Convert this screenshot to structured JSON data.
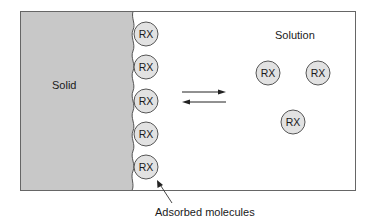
{
  "diagram": {
    "regions": {
      "solid_label": "Solid",
      "solution_label": "Solution"
    },
    "molecule_label": "RX",
    "adsorbed_molecules": [
      {
        "label": "RX",
        "cx": 146,
        "cy": 34
      },
      {
        "label": "RX",
        "cx": 146,
        "cy": 67
      },
      {
        "label": "RX",
        "cx": 146,
        "cy": 101
      },
      {
        "label": "RX",
        "cx": 146,
        "cy": 134
      },
      {
        "label": "RX",
        "cx": 146,
        "cy": 167
      }
    ],
    "solution_molecules": [
      {
        "label": "RX",
        "cx": 268,
        "cy": 73
      },
      {
        "label": "RX",
        "cx": 318,
        "cy": 73
      },
      {
        "label": "RX",
        "cx": 293,
        "cy": 122
      }
    ],
    "equilibrium_arrows": {
      "forward": "right",
      "reverse": "left"
    },
    "annotation": "Adsorbed molecules",
    "colors": {
      "solid_fill": "#c8c8c8",
      "molecule_fill": "#e2e2e2",
      "stroke": "#555555",
      "frame": "#666666",
      "text": "#1a1a1a"
    }
  }
}
